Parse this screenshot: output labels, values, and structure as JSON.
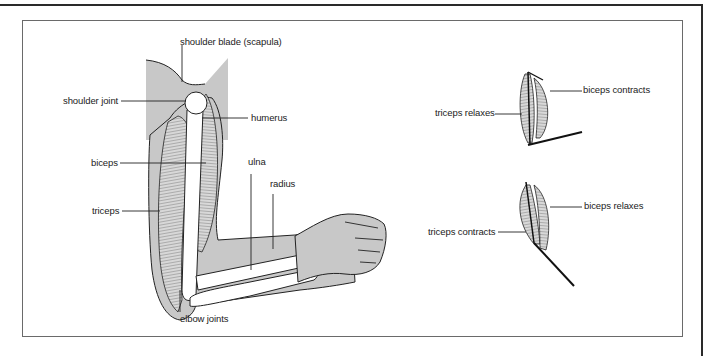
{
  "diagram": {
    "type": "anatomy",
    "main_figure": {
      "labels": {
        "shoulder_blade": "shoulder blade (scapula)",
        "shoulder_joint": "shoulder joint",
        "humerus": "humerus",
        "biceps": "biceps",
        "ulna": "ulna",
        "radius": "radius",
        "triceps": "triceps",
        "elbow_joints": "elbow joints"
      }
    },
    "flexed_figure": {
      "labels": {
        "biceps": "biceps contracts",
        "triceps": "triceps relaxes"
      }
    },
    "extended_figure": {
      "labels": {
        "biceps": "biceps relaxes",
        "triceps": "triceps contracts"
      }
    },
    "colors": {
      "shade": "#c8c8c8",
      "bone": "#ffffff",
      "outline": "#1a1a1a",
      "frame": "#6a6a6a"
    }
  }
}
